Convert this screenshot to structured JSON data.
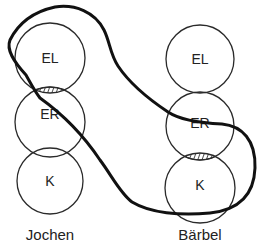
{
  "diagram": {
    "type": "venn-like ego-state diagram",
    "colors": {
      "stroke": "#2a2a2a",
      "outline": "#111111",
      "background": "#ffffff"
    },
    "persons": [
      {
        "name": "Jochen",
        "circles": [
          {
            "label": "EL"
          },
          {
            "label": "ER"
          },
          {
            "label": "K"
          }
        ],
        "hatched_overlap": "EL-ER"
      },
      {
        "name": "Bärbel",
        "circles": [
          {
            "label": "EL"
          },
          {
            "label": "ER"
          },
          {
            "label": "K"
          }
        ],
        "hatched_overlap": "ER-K"
      }
    ],
    "outline": "thick enclosing loop connecting Jochen EL/ER overlap with Bärbel ER/K overlap"
  }
}
